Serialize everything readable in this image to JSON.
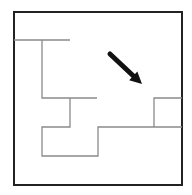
{
  "diagram": {
    "type": "maze-floorplan",
    "colors": {
      "background": "#ffffff",
      "border": "#222222",
      "walls": "#8a8a8a",
      "arrow": "#111111"
    },
    "border": {
      "x": 14,
      "y": 12,
      "width": 168,
      "height": 173
    },
    "walls": [
      {
        "id": "wall-1",
        "points": "14,40 70,40"
      },
      {
        "id": "wall-2",
        "points": "42,40 42,98 97,98"
      },
      {
        "id": "wall-3",
        "points": "70,98 70,127 42,127 42,156 98,156 98,127 182,127"
      },
      {
        "id": "wall-4",
        "points": "154,127 154,98 182,98"
      }
    ],
    "arrow": {
      "from": [
        110,
        54
      ],
      "to": [
        142,
        84
      ],
      "direction": "down-right"
    }
  }
}
